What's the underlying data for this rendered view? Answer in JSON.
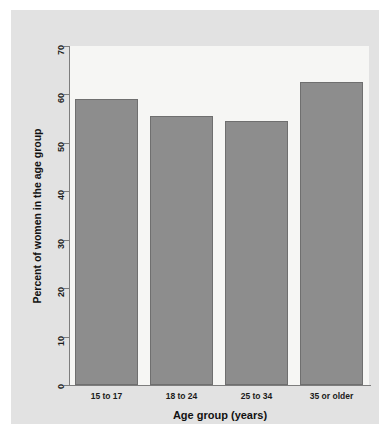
{
  "chart_data": {
    "type": "bar",
    "title": "",
    "categories": [
      "15 to 17",
      "18 to 24",
      "25 to 34",
      "35 or older"
    ],
    "values": [
      59.0,
      55.5,
      54.6,
      62.5
    ],
    "xlabel": "Age group (years)",
    "ylabel": "Percent of women in the age group",
    "ylim": [
      0,
      70
    ],
    "yticks": [
      0,
      10,
      20,
      30,
      40,
      50,
      60,
      70
    ],
    "ytick_labels": [
      "0",
      "10",
      "20",
      "30",
      "40",
      "50",
      "60",
      "70"
    ],
    "grid": false,
    "legend": null,
    "bar_color": "#8d8d8d",
    "bar_edge_color": "#6f6f6f",
    "plot_background": "#f6f6f4",
    "figure_background": "#e2e2e2",
    "axis_color": "#7d7d7d"
  }
}
